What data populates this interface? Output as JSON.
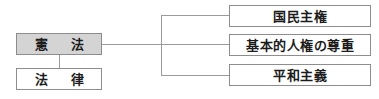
{
  "diagram": {
    "type": "hierarchy-bracket",
    "background_color": "#ffffff",
    "line_color": "#9a9a9a",
    "border_color": "#8d8d8d",
    "text_color": "#1c1c1c",
    "shaded_fill": "#d4d4d4",
    "left_nodes": [
      {
        "id": "kenpou",
        "label": "憲　法",
        "filled": "shaded"
      },
      {
        "id": "houritsu",
        "label": "法　律",
        "filled": "white"
      }
    ],
    "right_nodes": [
      {
        "id": "shuken",
        "label": "国民主権"
      },
      {
        "id": "jinken",
        "label": "基本的人権の尊重"
      },
      {
        "id": "heiwa",
        "label": "平和主義"
      }
    ]
  }
}
